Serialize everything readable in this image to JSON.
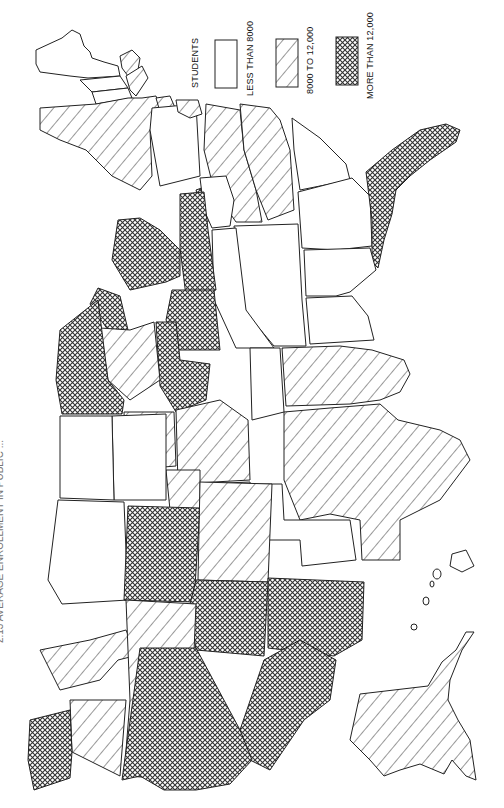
{
  "figure": {
    "title_partial": "2.13 AVERAGE ENROLLMENT IN PUBLIC ...",
    "orientation": "rotated 90° (north at left, east at top)"
  },
  "legend": {
    "heading": "STUDENTS",
    "items": [
      {
        "label": "LESS THAN 8000",
        "pattern": "blank",
        "color": "#ffffff"
      },
      {
        "label": "8000 TO 12,000",
        "pattern": "diagonal-hatch",
        "color": "#222222"
      },
      {
        "label": "MORE THAN 12,000",
        "pattern": "crosshatch",
        "color": "#222222"
      }
    ]
  },
  "colors": {
    "stroke": "#222222",
    "background": "#ffffff",
    "pattern_ink": "#333333"
  },
  "regions": {
    "less_than_8000": [
      "Maine",
      "New Hampshire",
      "Vermont",
      "Pennsylvania",
      "West Virginia",
      "Kentucky",
      "Tennessee",
      "Mississippi",
      "Alabama",
      "Georgia",
      "South Carolina",
      "North Dakota",
      "South Dakota",
      "Montana",
      "Wyoming",
      "Idaho",
      "Nebraska",
      "Kansas",
      "Oklahoma",
      "Arkansas",
      "Hawaii"
    ],
    "8000_to_12000": [
      "New York",
      "Massachusetts",
      "Connecticut",
      "New Jersey",
      "Delaware",
      "Virginia",
      "North Carolina",
      "Iowa",
      "Missouri",
      "Wisconsin",
      "Louisiana",
      "Texas",
      "Colorado",
      "Oregon",
      "Nevada",
      "Alaska"
    ],
    "more_than_12000": [
      "Maryland",
      "Florida",
      "Michigan",
      "Ohio",
      "Indiana",
      "Illinois",
      "Minnesota",
      "Washington",
      "Utah",
      "Arizona",
      "New Mexico",
      "California"
    ]
  }
}
